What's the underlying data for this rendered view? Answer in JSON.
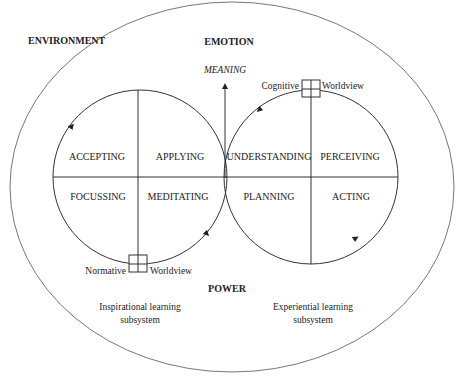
{
  "diagram": {
    "outer_labels": {
      "environment": "ENVIRONMENT",
      "emotion": "EMOTION",
      "power": "POWER"
    },
    "meaning_arrow": {
      "label": "MEANING"
    },
    "left_cycle": {
      "quadrants": {
        "top_left": "ACCEPTING",
        "top_right": "APPLYING",
        "bottom_left": "FOCUSSING",
        "bottom_right": "MEDITATING"
      },
      "box_left_label": "Normative",
      "box_right_label": "Worldview",
      "subsystem_line1": "Inspirational learning",
      "subsystem_line2": "subsystem"
    },
    "right_cycle": {
      "quadrants": {
        "top_left": "UNDERSTANDING",
        "top_right": "PERCEIVING",
        "bottom_left": "PLANNING",
        "bottom_right": "ACTING"
      },
      "box_left_label": "Cognitive",
      "box_right_label": "Worldview",
      "subsystem_line1": "Experiential learning",
      "subsystem_line2": "subsystem"
    },
    "colors": {
      "line": "#333333",
      "outer": "#777777",
      "text": "#222222",
      "background": "#ffffff"
    }
  }
}
